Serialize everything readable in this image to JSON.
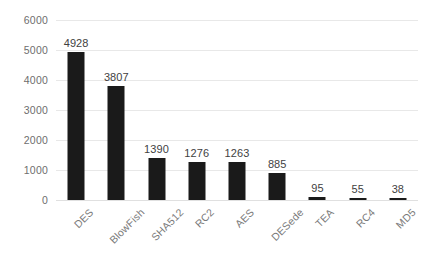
{
  "chart_data": {
    "type": "bar",
    "title": "",
    "subtitle": "",
    "xlabel": "",
    "ylabel": "",
    "categories": [
      "DES",
      "BlowFish",
      "SHA512",
      "RC2",
      "AES",
      "DESede",
      "TEA",
      "RC4",
      "MD5"
    ],
    "values": [
      4928,
      3807,
      1390,
      1276,
      1263,
      885,
      95,
      55,
      38
    ],
    "data_labels": [
      "4928",
      "3807",
      "1390",
      "1276",
      "1263",
      "885",
      "95",
      "55",
      "38"
    ],
    "ylim": [
      0,
      6000
    ],
    "yticks": [
      0,
      1000,
      2000,
      3000,
      4000,
      5000,
      6000
    ],
    "ytick_labels": [
      "0",
      "1000",
      "2000",
      "3000",
      "4000",
      "5000",
      "6000"
    ],
    "grid": true,
    "grid_axis": "y",
    "legend": false,
    "legend_position": "none",
    "xtick_rotation": -45,
    "colors": {
      "bar": "#1a1a1a",
      "gridline": "#e8e8e8",
      "tick_label": "#6e6e6e",
      "category_label": "#7a7a7a",
      "data_label": "#3f3f3f",
      "background": "#ffffff"
    }
  }
}
